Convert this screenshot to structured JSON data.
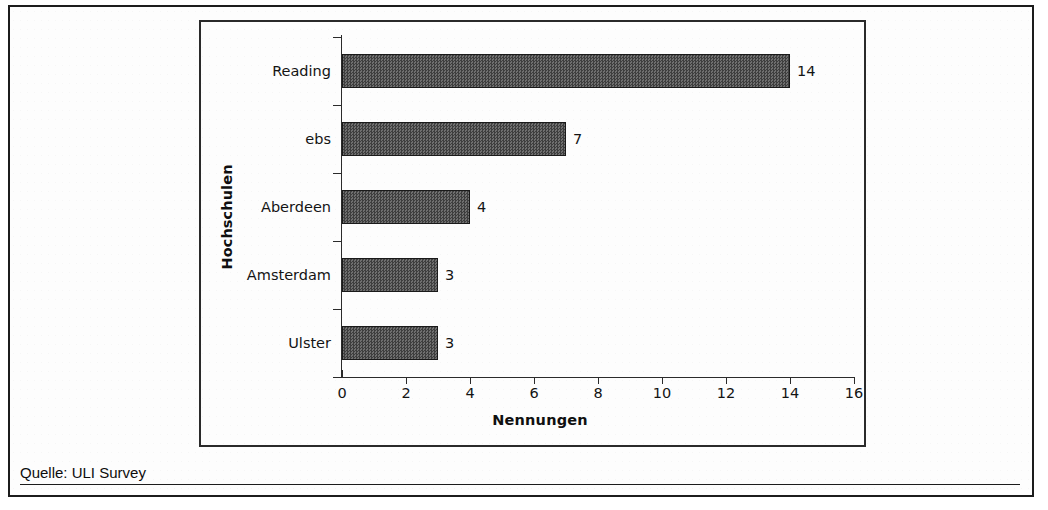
{
  "source_note": "Quelle: ULI Survey",
  "chart_data": {
    "type": "bar",
    "orientation": "horizontal",
    "title": "",
    "subtitle": "",
    "xlabel": "Nennungen",
    "ylabel": "Hochschulen",
    "categories": [
      "Reading",
      "ebs",
      "Aberdeen",
      "Amsterdam",
      "Ulster"
    ],
    "values": [
      14,
      7,
      4,
      3,
      3
    ],
    "data_labels": [
      "14",
      "7",
      "4",
      "3",
      "3"
    ],
    "xlim": [
      0,
      16
    ],
    "xticks": [
      0,
      2,
      4,
      6,
      8,
      10,
      12,
      14,
      16
    ],
    "xtick_labels": [
      "0",
      "2",
      "4",
      "6",
      "8",
      "10",
      "12",
      "14",
      "16"
    ],
    "grid": false,
    "legend": false,
    "bar_fill_color": "#545454",
    "bar_edge_color": "#1a1a1a",
    "axis_color": "#2b2b2b",
    "background_color": "#fdfdfd"
  }
}
